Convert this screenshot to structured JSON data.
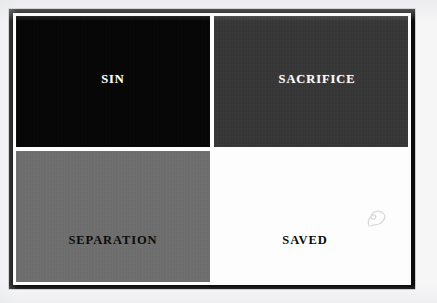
{
  "page": {
    "background_color": "#f6f6f7",
    "type": "scanned-quadrant-diagram"
  },
  "frame": {
    "border_color": "#0b0b0b",
    "inner_gap_color": "#fdfdfd",
    "divider_color": "#fefefe"
  },
  "diagram": {
    "name": "four-quadrant-diagram",
    "rows": 2,
    "columns": 2,
    "quadrants": [
      {
        "id": "sin",
        "label": "SIN",
        "position": "top-left",
        "fill_color": "#050505",
        "text_color": "#ffffff"
      },
      {
        "id": "sacrifice",
        "label": "SACRIFICE",
        "position": "top-right",
        "fill_color": "#373737",
        "text_color": "#ffffff"
      },
      {
        "id": "separation",
        "label": "SEPARATION",
        "position": "bottom-left",
        "fill_color": "#6f6f6f",
        "text_color": "#0a0a0a"
      },
      {
        "id": "saved",
        "label": "SAVED",
        "position": "bottom-right",
        "fill_color": "#fdfdfd",
        "text_color": "#0a0a0a"
      }
    ]
  },
  "annotations": {
    "pencil_mark": {
      "name": "pencil-squiggle-mark",
      "description": "faint handwritten pencil squiggle",
      "color": "#8a8a8a"
    }
  }
}
